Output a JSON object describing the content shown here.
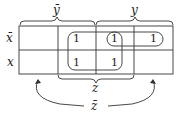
{
  "kmap": {
    "row_labels": [
      "x̄",
      "x"
    ],
    "column_group_labels": {
      "top_left": "ȳ",
      "top_right": "y",
      "bottom_middle": "z",
      "bottom_outer": "z̄"
    },
    "cells": [
      [
        "",
        "1",
        "1",
        "1"
      ],
      [
        "",
        "1",
        "1",
        ""
      ]
    ],
    "groupings": [
      {
        "name": "quad",
        "cells": "columns 2-3, rows 1-2"
      },
      {
        "name": "pair-top-right",
        "cells": "row 1, columns 3-4"
      }
    ]
  },
  "colors": {
    "ink": "#222222",
    "background": "#ffffff"
  }
}
